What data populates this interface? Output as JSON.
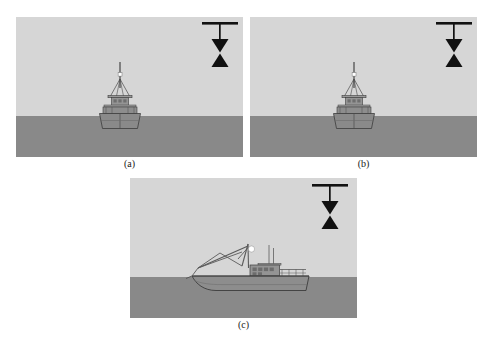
{
  "figure": {
    "type": "nautical-day-shapes-diagram",
    "panel_count": 3,
    "background_color": "#ffffff",
    "sky_color": "#d6d6d6",
    "sea_color": "#898989",
    "hull_color": "#8d8d8d",
    "outline_color": "#3c3c3c",
    "shape_color": "#111111",
    "light_color": "#ffffff"
  },
  "panels": [
    {
      "id": "a",
      "caption": "(a)",
      "view": "bow-on",
      "vessel": "fishing vessel seen head-on with mast and masthead light",
      "day_shape": "two-cones-apex-to-apex",
      "day_shape_position": "suspended from yardarm at upper right",
      "x": 16,
      "y": 17,
      "width": 227,
      "height": 140,
      "waterline_y": 99
    },
    {
      "id": "b",
      "caption": "(b)",
      "view": "bow-on",
      "vessel": "fishing vessel seen head-on with mast and masthead light",
      "day_shape": "two-cones-apex-to-apex",
      "day_shape_position": "suspended from yardarm at upper right",
      "x": 250,
      "y": 17,
      "width": 227,
      "height": 140,
      "waterline_y": 99
    },
    {
      "id": "c",
      "caption": "(c)",
      "view": "side-profile",
      "vessel": "fishing trawler in profile with derrick boom, gantry, wheelhouse and masthead light",
      "day_shape": "two-cones-apex-to-apex",
      "day_shape_position": "suspended from yardarm at upper right",
      "x": 130,
      "y": 178,
      "width": 227,
      "height": 140,
      "waterline_y": 99
    }
  ],
  "captions": {
    "a": "(a)",
    "b": "(b)",
    "c": "(c)"
  },
  "day_shape_symbol": {
    "name": "two-cones-point-to-point",
    "parts": [
      "yardarm-bar",
      "vertical-hoist-line",
      "upper-cone-point-down",
      "lower-cone-point-up"
    ],
    "meaning": "vessel engaged in fishing"
  }
}
